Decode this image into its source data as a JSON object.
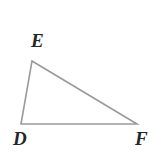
{
  "figure": {
    "name": "triangle-DEF",
    "type": "triangle",
    "background_color": "#ffffff",
    "stroke_color": "#9a9a9a",
    "stroke_width": 1.6,
    "label_color": "#262626",
    "vertices": [
      {
        "id": "E",
        "label": "E",
        "x": 32,
        "y": 61,
        "label_x": 31,
        "label_y": 31
      },
      {
        "id": "D",
        "label": "D",
        "x": 21,
        "y": 124,
        "label_x": 13,
        "label_y": 129
      },
      {
        "id": "F",
        "label": "F",
        "x": 137,
        "y": 124,
        "label_x": 135,
        "label_y": 129
      }
    ],
    "edges": [
      {
        "id": "DE",
        "from": "D",
        "to": "E"
      },
      {
        "id": "EF",
        "from": "E",
        "to": "F"
      },
      {
        "id": "DF",
        "from": "D",
        "to": "F"
      }
    ]
  }
}
